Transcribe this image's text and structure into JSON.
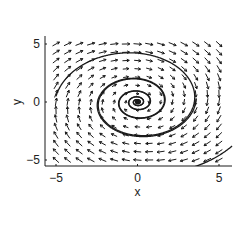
{
  "chart_data": {
    "type": "vector_field",
    "title": "",
    "xlabel": "x",
    "ylabel": "y",
    "xlim": [
      -5.7,
      5.7
    ],
    "ylim": [
      -5.8,
      5.8
    ],
    "xticks": [
      -5,
      0,
      5
    ],
    "yticks": [
      -5,
      0,
      5
    ],
    "xtick_labels": [
      "−5",
      "0",
      "5"
    ],
    "ytick_labels": [
      "−5",
      "0",
      "5"
    ],
    "grid": false,
    "legend": null,
    "field": {
      "description": "spiral sink: dx/dt = y - a*x, dy/dt = -x - a*y (clockwise rotation, trajectories spiral into origin)",
      "a": 0.12,
      "grid_x": {
        "start": -5,
        "stop": 5,
        "count": 15
      },
      "grid_y": {
        "start": -5,
        "stop": 5,
        "count": 15
      },
      "arrow_length_px": 8
    },
    "trajectories": [
      {
        "start": [
          6.0,
          5.8
        ],
        "note": "top-right corner entering curve"
      },
      {
        "start": [
          -5.0,
          0.5
        ],
        "note": "outer spiral"
      },
      {
        "start": [
          3.6,
          0.3
        ],
        "note": "inner spirals"
      },
      {
        "start": [
          5.8,
          -3.8
        ],
        "note": "bottom-right curve"
      }
    ],
    "equilibrium": {
      "x": 0,
      "y": 0,
      "type": "stable spiral"
    }
  },
  "colors": {
    "ink": "#1a1a1a",
    "background": "#ffffff"
  }
}
